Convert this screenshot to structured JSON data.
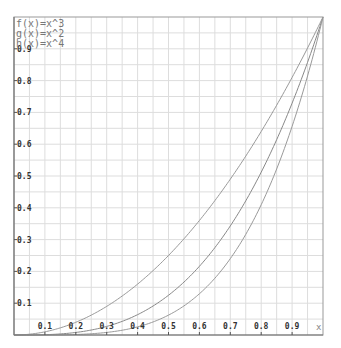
{
  "chart_data": {
    "type": "line",
    "title": "",
    "xlabel": "x",
    "ylabel": "",
    "xlim": [
      0,
      1
    ],
    "ylim": [
      0,
      1
    ],
    "grid": true,
    "grid_step": 0.05,
    "legend_position": "top-left",
    "x_ticks": [
      "0.1",
      "0.2",
      "0.3",
      "0.4",
      "0.5",
      "0.6",
      "0.7",
      "0.8",
      "0.9"
    ],
    "y_ticks": [
      "0.1",
      "0.2",
      "0.3",
      "0.4",
      "0.5",
      "0.6",
      "0.7",
      "0.8",
      "0.9"
    ],
    "series": [
      {
        "name": "f(x)=x^3",
        "exponent": 3,
        "color": "#888888",
        "x": [
          0,
          0.1,
          0.2,
          0.3,
          0.4,
          0.5,
          0.6,
          0.7,
          0.8,
          0.9,
          1.0
        ],
        "values": [
          0,
          0.001,
          0.008,
          0.027,
          0.064,
          0.125,
          0.216,
          0.343,
          0.512,
          0.729,
          1.0
        ]
      },
      {
        "name": "g(x)=x^2",
        "exponent": 2,
        "color": "#999999",
        "x": [
          0,
          0.1,
          0.2,
          0.3,
          0.4,
          0.5,
          0.6,
          0.7,
          0.8,
          0.9,
          1.0
        ],
        "values": [
          0,
          0.01,
          0.04,
          0.09,
          0.16,
          0.25,
          0.36,
          0.49,
          0.64,
          0.81,
          1.0
        ]
      },
      {
        "name": "h(x)=x^4",
        "exponent": 4,
        "color": "#999999",
        "x": [
          0,
          0.1,
          0.2,
          0.3,
          0.4,
          0.5,
          0.6,
          0.7,
          0.8,
          0.9,
          1.0
        ],
        "values": [
          0,
          0.0001,
          0.0016,
          0.0081,
          0.0256,
          0.0625,
          0.1296,
          0.2401,
          0.4096,
          0.6561,
          1.0
        ]
      }
    ]
  },
  "colors": {
    "background": "#ffffff",
    "grid": "#dddddd",
    "axis": "#888888",
    "tick_label": "#333333",
    "legend_text": "#777777"
  }
}
